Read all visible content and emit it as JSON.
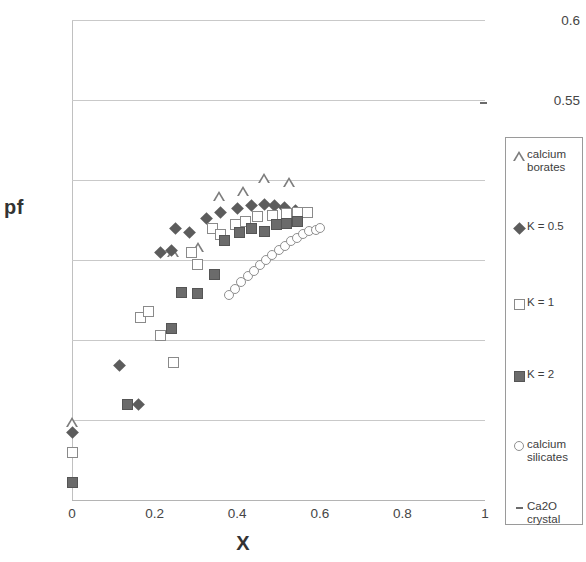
{
  "chart_data": {
    "type": "scatter",
    "title": "",
    "xlabel": "X",
    "ylabel": "pf",
    "xlim": [
      0,
      1
    ],
    "ylim": [
      0.3,
      0.6
    ],
    "xticks": [
      "0",
      "0.2",
      "0.4",
      "0.6",
      "0.8",
      "1"
    ],
    "xtick_values": [
      0,
      0.2,
      0.4,
      0.6,
      0.8,
      1
    ],
    "yticks": [
      "0.3",
      "0.35",
      "0.4",
      "0.45",
      "0.5",
      "0.55",
      "0.6"
    ],
    "ytick_values": [
      0.3,
      0.35,
      0.4,
      0.45,
      0.5,
      0.55,
      0.6
    ],
    "grid": "horizontal",
    "legend_position": "right-outside",
    "marker_color": "#6b6b6b",
    "gridline_color": "#c9c9c9",
    "series": [
      {
        "name": "calcium borates",
        "marker": "open-triangle",
        "points": [
          [
            0.0,
            0.349
          ],
          [
            0.245,
            0.455
          ],
          [
            0.305,
            0.458
          ],
          [
            0.355,
            0.49
          ],
          [
            0.415,
            0.493
          ],
          [
            0.465,
            0.501
          ],
          [
            0.525,
            0.499
          ]
        ]
      },
      {
        "name": "K = 0.5",
        "marker": "filled-diamond",
        "points": [
          [
            0.0,
            0.342
          ],
          [
            0.115,
            0.384
          ],
          [
            0.16,
            0.36
          ],
          [
            0.215,
            0.455
          ],
          [
            0.24,
            0.456
          ],
          [
            0.25,
            0.47
          ],
          [
            0.285,
            0.467
          ],
          [
            0.325,
            0.476
          ],
          [
            0.36,
            0.48
          ],
          [
            0.4,
            0.482
          ],
          [
            0.435,
            0.484
          ],
          [
            0.465,
            0.485
          ],
          [
            0.49,
            0.484
          ],
          [
            0.515,
            0.483
          ],
          [
            0.54,
            0.481
          ]
        ]
      },
      {
        "name": "K = 1",
        "marker": "open-square",
        "points": [
          [
            0.0,
            0.33
          ],
          [
            0.165,
            0.414
          ],
          [
            0.185,
            0.418
          ],
          [
            0.215,
            0.403
          ],
          [
            0.245,
            0.386
          ],
          [
            0.29,
            0.455
          ],
          [
            0.305,
            0.447
          ],
          [
            0.34,
            0.47
          ],
          [
            0.36,
            0.466
          ],
          [
            0.395,
            0.472
          ],
          [
            0.42,
            0.474
          ],
          [
            0.45,
            0.477
          ],
          [
            0.485,
            0.478
          ],
          [
            0.52,
            0.479
          ],
          [
            0.545,
            0.48
          ],
          [
            0.57,
            0.48
          ]
        ]
      },
      {
        "name": "K = 2",
        "marker": "filled-square",
        "points": [
          [
            0.0,
            0.311
          ],
          [
            0.135,
            0.36
          ],
          [
            0.24,
            0.407
          ],
          [
            0.265,
            0.43
          ],
          [
            0.305,
            0.429
          ],
          [
            0.345,
            0.441
          ],
          [
            0.37,
            0.462
          ],
          [
            0.405,
            0.467
          ],
          [
            0.435,
            0.47
          ],
          [
            0.465,
            0.468
          ],
          [
            0.495,
            0.472
          ],
          [
            0.52,
            0.473
          ],
          [
            0.545,
            0.474
          ]
        ]
      },
      {
        "name": "calcium silicates",
        "marker": "open-circle",
        "points": [
          [
            0.38,
            0.428
          ],
          [
            0.395,
            0.432
          ],
          [
            0.41,
            0.436
          ],
          [
            0.425,
            0.44
          ],
          [
            0.44,
            0.443
          ],
          [
            0.455,
            0.447
          ],
          [
            0.47,
            0.45
          ],
          [
            0.485,
            0.453
          ],
          [
            0.5,
            0.456
          ],
          [
            0.515,
            0.459
          ],
          [
            0.53,
            0.462
          ],
          [
            0.545,
            0.464
          ],
          [
            0.56,
            0.466
          ],
          [
            0.575,
            0.468
          ],
          [
            0.59,
            0.469
          ],
          [
            0.6,
            0.47
          ]
        ]
      },
      {
        "name": "Ca2O crystal",
        "marker": "dash",
        "points": [
          [
            0.997,
            0.548
          ]
        ]
      }
    ]
  },
  "legend": {
    "items": [
      {
        "marker": "open-triangle",
        "label": "calcium\nborates"
      },
      {
        "marker": "filled-diamond",
        "label": "K = 0.5"
      },
      {
        "marker": "open-square",
        "label": "K = 1"
      },
      {
        "marker": "filled-square",
        "label": "K = 2"
      },
      {
        "marker": "open-circle",
        "label": "calcium\nsilicates"
      },
      {
        "marker": "dash",
        "label": "Ca2O\ncrystal"
      }
    ]
  }
}
